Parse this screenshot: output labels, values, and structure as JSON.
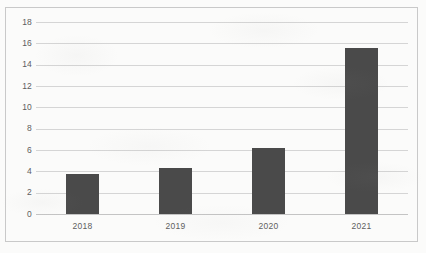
{
  "chart_data": {
    "type": "bar",
    "title": "",
    "subtitle": "",
    "xlabel": "",
    "ylabel": "",
    "categories": [
      "2018",
      "2019",
      "2020",
      "2021"
    ],
    "values": [
      3.8,
      4.3,
      6.2,
      15.6
    ],
    "ylim": [
      0,
      18
    ],
    "ytick_step": 2,
    "yticks": [
      18,
      16,
      14,
      12,
      10,
      8,
      6,
      4,
      2,
      0
    ],
    "ytick_labels": [
      "18",
      "16",
      "14",
      "12",
      "10",
      "8",
      "6",
      "4",
      "2",
      "0"
    ],
    "grid": true,
    "grid_axis": "y",
    "legend": false,
    "legend_position": "none",
    "series": [
      {
        "name": "",
        "values": [
          3.8,
          4.3,
          6.2,
          15.6
        ]
      }
    ],
    "colors": {
      "bar": "#4a4a4a",
      "gridline": "#d5d5d5",
      "baseline": "#c4c4c4",
      "frame": "#c9c9c9",
      "background": "#fbfbfa",
      "tick_text": "#5e5e5e"
    }
  }
}
